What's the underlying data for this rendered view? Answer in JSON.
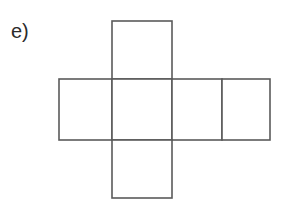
{
  "figure": {
    "label": "e)",
    "label_position": {
      "x": 11,
      "y": 19
    },
    "background_color": "#ffffff",
    "stroke_color": "#5a5a5a",
    "stroke_width": 1.6,
    "canvas": {
      "width": 289,
      "height": 207
    }
  },
  "net": {
    "grid": {
      "x_lines": [
        59,
        112,
        172,
        222,
        270
      ],
      "y_lines": [
        21,
        79,
        140,
        198
      ]
    },
    "faces": [
      {
        "name": "top-face",
        "x": 112,
        "y": 21,
        "width": 60,
        "height": 58
      },
      {
        "name": "middle-left-face",
        "x": 59,
        "y": 79,
        "width": 53,
        "height": 61
      },
      {
        "name": "middle-center-face",
        "x": 112,
        "y": 79,
        "width": 60,
        "height": 61
      },
      {
        "name": "middle-right-face",
        "x": 172,
        "y": 79,
        "width": 50,
        "height": 61
      },
      {
        "name": "far-right-face",
        "x": 222,
        "y": 79,
        "width": 48,
        "height": 61
      },
      {
        "name": "bottom-face",
        "x": 112,
        "y": 140,
        "width": 60,
        "height": 58
      }
    ],
    "face_count": 6
  },
  "chart_data": {
    "type": "diagram",
    "title": "e)",
    "subtitle": "",
    "shape": "cube-net-cross",
    "faces": [
      {
        "id": "top",
        "row": 0,
        "col": 1,
        "x": 112,
        "y": 21,
        "w": 60,
        "h": 58
      },
      {
        "id": "left",
        "row": 1,
        "col": 0,
        "x": 59,
        "y": 79,
        "w": 53,
        "h": 61
      },
      {
        "id": "center",
        "row": 1,
        "col": 1,
        "x": 112,
        "y": 79,
        "w": 60,
        "h": 61
      },
      {
        "id": "right",
        "row": 1,
        "col": 2,
        "x": 172,
        "y": 79,
        "w": 50,
        "h": 61
      },
      {
        "id": "far-right",
        "row": 1,
        "col": 3,
        "x": 222,
        "y": 79,
        "w": 48,
        "h": 61
      },
      {
        "id": "bottom",
        "row": 2,
        "col": 1,
        "x": 112,
        "y": 140,
        "w": 60,
        "h": 58
      }
    ],
    "annotations": [
      "e)"
    ],
    "grid": false,
    "legend": null
  }
}
